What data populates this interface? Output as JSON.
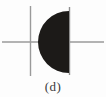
{
  "figure": {
    "caption": "(d)",
    "background_color": "#fdfdfd",
    "axis_color": "#9a9a9a",
    "boundary_color": "#8d8d8d",
    "fill_color": "#1c1a18",
    "axes": {
      "horizontal": {
        "label": "x-axis",
        "y": 42,
        "x_start": 2,
        "x_end": 104
      },
      "vertical": {
        "label": "y-axis",
        "x": 30,
        "y_start": 6,
        "y_end": 76
      },
      "origin": {
        "x": 30,
        "y": 42
      }
    },
    "region": {
      "shape": "half-disk",
      "flat_edge_side": "right",
      "arc_side": "left",
      "center_x": 69,
      "center_y": 42,
      "radius": 31,
      "top_y": 11,
      "bottom_y": 73,
      "leftmost_x": 38,
      "chord_x": 69
    },
    "chord_line": {
      "label": "vertical-chord-boundary",
      "x": 69,
      "y_top": 7,
      "y_bottom": 75
    }
  }
}
